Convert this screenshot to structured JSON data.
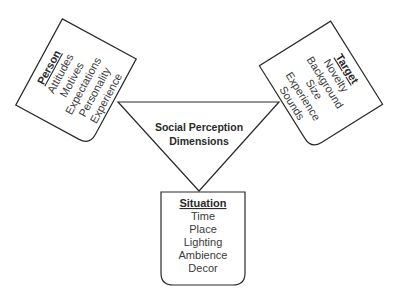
{
  "center": {
    "line1": "Social Perception",
    "line2": "Dimensions"
  },
  "person": {
    "title": "Person",
    "items": [
      "Attitudes",
      "Motives",
      "Expectations",
      "Personality",
      "Experience"
    ]
  },
  "target": {
    "title": "Target",
    "items": [
      "Novelty",
      "Background",
      "Size",
      "Experience",
      "Sounds"
    ]
  },
  "situation": {
    "title": "Situation",
    "items": [
      "Time",
      "Place",
      "Lighting",
      "Ambience",
      "Decor"
    ]
  },
  "colors": {
    "stroke": "#2a2a2a",
    "text": "#3a3a3a",
    "background": "#ffffff"
  }
}
